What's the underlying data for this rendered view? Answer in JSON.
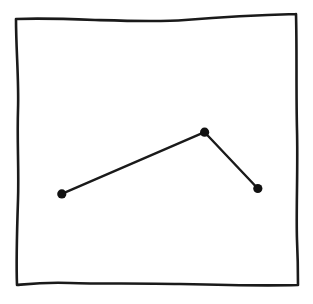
{
  "chart_data": {
    "type": "line",
    "title": "",
    "xlabel": "",
    "ylabel": "",
    "style": "hand-drawn sketch",
    "grid": false,
    "legend": null,
    "xlim": [
      0,
      100
    ],
    "ylim": [
      0,
      100
    ],
    "series": [
      {
        "name": "",
        "markers": true,
        "color": "#111111",
        "x": [
          16,
          67,
          86
        ],
        "values": [
          34,
          57,
          36
        ]
      }
    ]
  },
  "colors": {
    "ink": "#111111",
    "background": "#ffffff"
  },
  "canvas": {
    "frame": {
      "top_left": [
        16,
        19
      ],
      "top_right": [
        296,
        14
      ],
      "bottom_right": [
        298,
        285
      ],
      "bottom_left": [
        17,
        285
      ]
    },
    "plot_area": {
      "x0": 17,
      "x1": 297,
      "y_top": 17,
      "y_bottom": 285
    }
  }
}
